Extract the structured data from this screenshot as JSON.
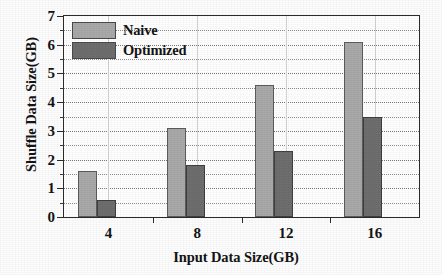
{
  "chart_data": {
    "type": "bar",
    "title": "",
    "subtitle": "",
    "xlabel": "Input Data Size(GB)",
    "ylabel": "Shuffle Data Size(GB)",
    "categories": [
      "4",
      "8",
      "12",
      "16"
    ],
    "series": [
      {
        "name": "Naive",
        "values": [
          1.6,
          3.1,
          4.6,
          6.1
        ],
        "color": "#a9a9a9"
      },
      {
        "name": "Optimized",
        "values": [
          0.6,
          1.8,
          2.3,
          3.5
        ],
        "color": "#6e6e6e"
      }
    ],
    "ylim": [
      0,
      7
    ],
    "ytick_labels": [
      "0",
      "1",
      "2",
      "3",
      "4",
      "5",
      "6",
      "7"
    ],
    "ytick_values": [
      0,
      1,
      2,
      3,
      4,
      5,
      6,
      7
    ],
    "yminor_values": [
      0.5,
      1.5,
      2.5,
      3.5,
      4.5,
      5.5,
      6.5
    ],
    "xtick_labels": [
      "4",
      "8",
      "12",
      "16"
    ],
    "grid": true,
    "grid_style": "dotted-horizontal",
    "legend_position": "upper-left",
    "legend_entries": [
      "Naive",
      "Optimized"
    ]
  },
  "axis": {
    "y_title": "Shuffle Data Size(GB)",
    "x_title": "Input Data Size(GB)"
  },
  "legend": {
    "naive_label": "Naive",
    "optimized_label": "Optimized"
  }
}
